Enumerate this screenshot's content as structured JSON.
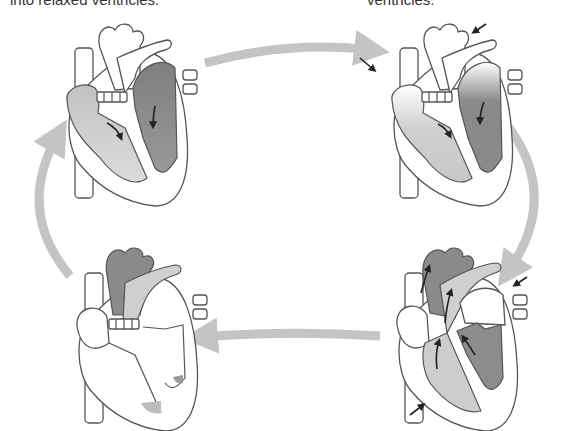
{
  "captions": {
    "left": "into relaxed ventricles.",
    "right": "ventricles."
  },
  "colors": {
    "cycle_arrow": "#c4c4c4",
    "light_chamber": "#cfcfcf",
    "dark_chamber": "#8c8c8c",
    "outline": "#555555",
    "flow_arrow": "#222222"
  },
  "diagram": {
    "type": "cardiac-cycle",
    "panels": [
      {
        "id": "top-left",
        "position": "top-left",
        "state": "atria-filling-ventricles",
        "pressure_arrows": 0
      },
      {
        "id": "top-right",
        "position": "top-right",
        "state": "atrial-contraction",
        "pressure_arrows": 2
      },
      {
        "id": "bottom-right",
        "position": "bottom-right",
        "state": "ventricular-ejection",
        "pressure_arrows": 2
      },
      {
        "id": "bottom-left",
        "position": "bottom-left",
        "state": "relaxation",
        "pressure_arrows": 0
      }
    ],
    "cycle_arrows": [
      {
        "from": "top-left",
        "to": "top-right",
        "direction": "right"
      },
      {
        "from": "top-right",
        "to": "bottom-right",
        "direction": "down"
      },
      {
        "from": "bottom-right",
        "to": "bottom-left",
        "direction": "left"
      },
      {
        "from": "bottom-left",
        "to": "top-left",
        "direction": "up"
      }
    ]
  }
}
